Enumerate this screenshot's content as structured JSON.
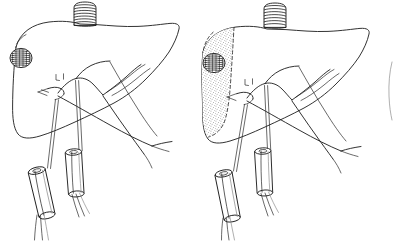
{
  "figure": {
    "background_color": "#ffffff",
    "ink_color": "#1b1b1b",
    "faint_ink_color": "#8d8d8d",
    "lesion_color": "#1a1a1a",
    "stipple_color": "#4a4a4a",
    "width": 396,
    "height": 241,
    "style": "hand-drawn line art, pen and ink, no labels or text"
  },
  "panels": [
    {
      "id": "panel-left",
      "name": "left-panel",
      "index": 1,
      "caption": "",
      "stage": "vascular-loops-placed",
      "ischemic_zone_visible": false,
      "ivc_stump": {
        "name": "inferior-vena-cava-stump",
        "shading": "light-horizontal-hatching",
        "band_count": 7
      },
      "lesion": {
        "name": "tumor-lesion",
        "shading": "dense-cross-hatching",
        "cx": 21,
        "cy": 58,
        "rx": 11,
        "ry": 9.5
      },
      "snares": [
        {
          "name": "tourniquet-snare-left",
          "cx": 42,
          "cy": 193,
          "angle": -13
        },
        {
          "name": "tourniquet-snare-right",
          "cx": 75,
          "cy": 173,
          "angle": -4
        }
      ]
    },
    {
      "id": "panel-right",
      "name": "right-panel",
      "index": 2,
      "caption": "",
      "stage": "demarcation-of-ischemic-segment",
      "ischemic_zone_visible": true,
      "ivc_stump": {
        "name": "inferior-vena-cava-stump",
        "shading": "dense-horizontal-hatching",
        "band_count": 7
      },
      "lesion": {
        "name": "tumor-lesion",
        "shading": "dense-cross-hatching",
        "cx": 214,
        "cy": 63,
        "rx": 11,
        "ry": 9.5
      },
      "demarcation": {
        "name": "resection-plane-dashed-line",
        "style": "dashed",
        "fill": "stippled",
        "meaning": "devascularized segment"
      },
      "snares": [
        {
          "name": "tourniquet-snare-left",
          "cx": 228,
          "cy": 196,
          "angle": -11
        },
        {
          "name": "tourniquet-snare-right",
          "cx": 264,
          "cy": 172,
          "angle": -3
        }
      ]
    },
    {
      "id": "panel-partial",
      "name": "third-panel-partial-edge",
      "index": 3,
      "caption": "",
      "stage": "cropped",
      "ischemic_zone_visible": false
    }
  ],
  "anatomy": {
    "liver": {
      "name": "liver-outline",
      "label": "Liver",
      "surfaces": [
        "diaphragmatic-dome",
        "inferior-border",
        "right-lobe",
        "left-lobe"
      ]
    },
    "structures": [
      {
        "name": "inferior-vena-cava",
        "label": "Inferior vena cava"
      },
      {
        "name": "porta-hepatis",
        "label": "Porta hepatis"
      },
      {
        "name": "portal-vein-branch",
        "label": "Portal vein branch"
      },
      {
        "name": "hepatic-artery-branch",
        "label": "Hepatic artery branch"
      },
      {
        "name": "bile-duct",
        "label": "Bile duct"
      },
      {
        "name": "tumor-lesion",
        "label": "Tumour"
      },
      {
        "name": "ischemic-segment",
        "label": "Devascularized segment"
      },
      {
        "name": "vessel-loop",
        "label": "Vessel loop / snare"
      },
      {
        "name": "tourniquet-tube",
        "label": "Rumel tourniquet"
      }
    ]
  }
}
